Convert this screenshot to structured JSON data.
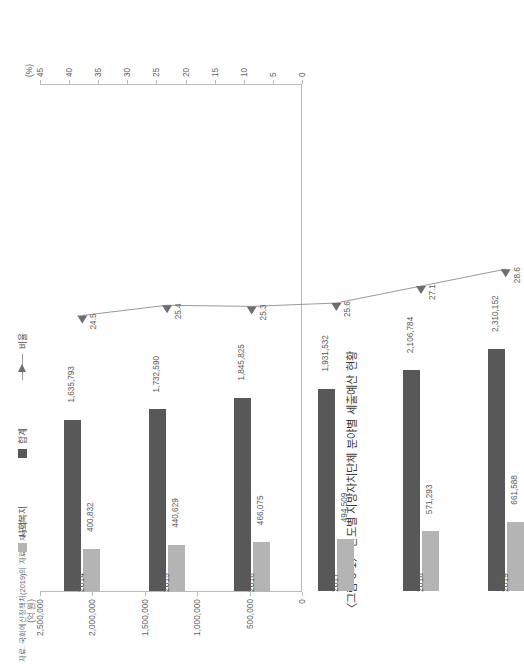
{
  "figure": {
    "title": "〈그림 8-1〉 연도별 지방자치단체 분야별 세출예산 현황",
    "source": "자료: 국회예산정책처(2019)의 자료를 재구성",
    "value_axis_unit": "(억 원)",
    "percent_axis_unit": "(%)"
  },
  "legend": {
    "items": [
      {
        "label": "사회복지",
        "marker": "square-swatch",
        "color": "#b4b4b4"
      },
      {
        "label": "합계",
        "marker": "square-swatch",
        "color": "#585858"
      },
      {
        "label": "비율",
        "marker": "line-triangle-marker",
        "color": "#9a9a9a"
      }
    ]
  },
  "colors": {
    "total_bar": "#585858",
    "welfare_bar": "#b4b4b4",
    "ratio_line": "#9a9a9a",
    "axis": "#b9b9b9",
    "text": "#5c5c5c"
  },
  "axes": {
    "value_ticks": [
      "2,500,000",
      "2,000,000",
      "1,500,000",
      "1,000,000",
      "500,000",
      "0"
    ],
    "percent_ticks": [
      "45",
      "40",
      "35",
      "30",
      "25",
      "20",
      "15",
      "10",
      "5",
      "0"
    ]
  },
  "chart_data": {
    "type": "bar",
    "title": "〈그림 8-1〉 연도별 지방자치단체 분야별 세출예산 현황",
    "subtitle": "",
    "xlabel": "",
    "ylabel": "(억 원)",
    "y2label": "(%)",
    "ylim": [
      0,
      2500000
    ],
    "y2lim": [
      0,
      45
    ],
    "grid": false,
    "legend_position": "bottom",
    "categories": [
      "2014",
      "2015",
      "2016",
      "2017",
      "2018",
      "2019"
    ],
    "series": [
      {
        "name": "합계",
        "type": "bar",
        "axis": "left",
        "color": "#585858",
        "values": [
          1635793,
          1732590,
          1845825,
          1931532,
          2106784,
          2310152
        ],
        "labels": [
          "1,635,793",
          "1,732,590",
          "1,845,825",
          "1,931,532",
          "2,106,784",
          "2,310,152"
        ]
      },
      {
        "name": "사회복지",
        "type": "bar",
        "axis": "left",
        "color": "#b4b4b4",
        "values": [
          400832,
          440629,
          466075,
          494509,
          571293,
          661588
        ],
        "labels": [
          "400,832",
          "440,629",
          "466,075",
          "494,509",
          "571,293",
          "661,588"
        ]
      },
      {
        "name": "비율",
        "type": "line",
        "axis": "right",
        "color": "#9a9a9a",
        "marker": "triangle",
        "values": [
          24.5,
          25.4,
          25.3,
          25.6,
          27.1,
          28.6
        ],
        "labels": [
          "24.5",
          "25.4",
          "25.3",
          "25.6",
          "27.1",
          "28.6"
        ]
      }
    ]
  }
}
